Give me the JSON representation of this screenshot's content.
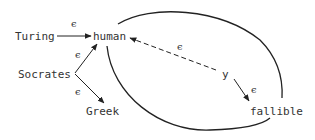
{
  "diagram": {
    "nodes": {
      "turing": "Turing",
      "human": "human",
      "socrates": "Socrates",
      "greek": "Greek",
      "y": "y",
      "fallible": "fallible"
    },
    "edges": [
      {
        "from": "Turing",
        "to": "human",
        "label": "ϵ",
        "style": "solid"
      },
      {
        "from": "Socrates",
        "to": "human",
        "label": "ϵ",
        "style": "solid"
      },
      {
        "from": "Socrates",
        "to": "Greek",
        "label": "ϵ",
        "style": "solid"
      },
      {
        "from": "y",
        "to": "human",
        "label": "ϵ",
        "style": "dashed"
      },
      {
        "from": "y",
        "to": "fallible",
        "label": "ϵ",
        "style": "solid"
      }
    ],
    "edge_labels": {
      "turing_human": "ϵ",
      "socrates_human": "ϵ",
      "socrates_greek": "ϵ",
      "y_human": "ϵ",
      "y_fallible": "ϵ"
    },
    "loop": "closed curve enclosing y, from human around to fallible"
  }
}
